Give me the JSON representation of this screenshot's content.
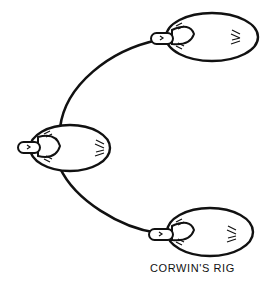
{
  "caption": "CORWIN'S RIG",
  "colors": {
    "ink": "#111111",
    "background": "#ffffff"
  },
  "floats": [
    {
      "position": "top-right"
    },
    {
      "position": "middle-left"
    },
    {
      "position": "bottom-right"
    }
  ]
}
